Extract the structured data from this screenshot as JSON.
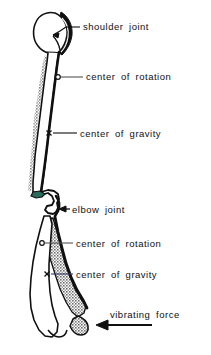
{
  "figure": {
    "background_color": "#ffffff",
    "ink_color": "#101010",
    "shade_color": "#8e8e8e",
    "width": 211,
    "height": 355
  },
  "labels": {
    "shoulder_joint": "shoulder  joint",
    "center_of_rotation_upper": "center  of  rotation",
    "center_of_gravity_upper": "center  of  gravity",
    "elbow_joint": "elbow  joint",
    "center_of_rotation_lower": "center  of  rotation",
    "center_of_gravity_lower": "center  of  gravity",
    "vibrating_force": "vibrating  force"
  },
  "markers": {
    "center_of_rotation_upper": {
      "glyph": "circle",
      "x": 58,
      "y": 77
    },
    "center_of_gravity_upper": {
      "glyph": "x",
      "x": 49,
      "y": 133
    },
    "center_of_rotation_lower": {
      "glyph": "circle",
      "x": 42,
      "y": 243
    },
    "center_of_gravity_lower": {
      "glyph": "x",
      "x": 47,
      "y": 274
    }
  },
  "annotations": {
    "shoulder_joint_arrow": "arrow pointing left into the glenohumeral joint space",
    "elbow_joint_arrow": "arrow pointing left at the elbow joint",
    "vibrating_force_arrow": "bold arrow pointing left at the distal forearm"
  },
  "anatomy": {
    "humerus": "upper arm bone with rounded head at top",
    "ulna_radius": "forearm bones, shaded gray",
    "joint_cartilage": "dark thickened joint surfaces"
  }
}
